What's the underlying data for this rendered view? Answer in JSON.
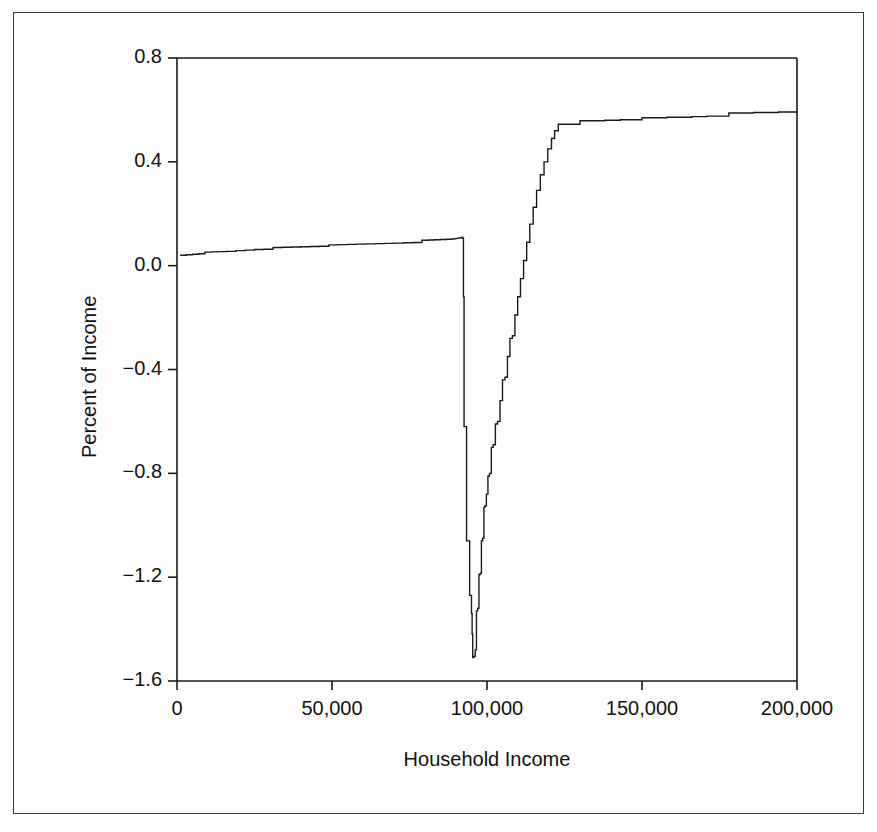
{
  "chart_data": {
    "type": "line",
    "title": "",
    "subtitle": "",
    "xlabel": "Household Income",
    "ylabel": "Percent of Income",
    "xlim": [
      0,
      200000
    ],
    "ylim": [
      -1.6,
      0.8
    ],
    "xticks": [
      0,
      50000,
      100000,
      150000,
      200000
    ],
    "xticklabels": [
      "0",
      "50,000",
      "100,000",
      "150,000",
      "200,000"
    ],
    "yticks": [
      0.8,
      0.4,
      0.0,
      -0.4,
      -0.8,
      -1.2,
      -1.6
    ],
    "yticklabels": [
      "0.8",
      "0.4",
      "0.0",
      "-0.4",
      "-0.8",
      "-1.2",
      "-1.6"
    ],
    "grid": false,
    "legend": null,
    "line_color": "#1a1a1a",
    "line_width": 1.4,
    "drawstyle": "steps-post",
    "annotations": [],
    "series": [
      {
        "name": "Percent of Income",
        "x": [
          1000,
          3000,
          5000,
          7000,
          9000,
          11000,
          13000,
          16000,
          19000,
          22000,
          25000,
          28000,
          31000,
          34000,
          37000,
          40000,
          43000,
          46000,
          49000,
          52000,
          55000,
          58000,
          61000,
          64000,
          67000,
          70000,
          73000,
          76000,
          79000,
          81000,
          83000,
          85000,
          87000,
          88500,
          89500,
          90200,
          90800,
          91300,
          91700,
          92000,
          92200,
          92400,
          92400,
          92600,
          93400,
          94400,
          95000,
          95200,
          95400,
          95800,
          96200,
          96600,
          97000,
          97400,
          97800,
          98200,
          98600,
          99000,
          99400,
          99800,
          100300,
          100800,
          101400,
          102000,
          102700,
          103400,
          104200,
          105000,
          105800,
          106600,
          107400,
          108200,
          109000,
          109900,
          110800,
          111800,
          112800,
          113800,
          114900,
          116000,
          117200,
          118400,
          119600,
          120800,
          121800,
          123000,
          130000,
          138000,
          143000,
          150000,
          158000,
          166000,
          171000,
          178000,
          186000,
          194000,
          200000
        ],
        "y": [
          0.04,
          0.042,
          0.044,
          0.046,
          0.052,
          0.053,
          0.054,
          0.055,
          0.058,
          0.06,
          0.062,
          0.063,
          0.07,
          0.071,
          0.072,
          0.073,
          0.074,
          0.075,
          0.08,
          0.081,
          0.082,
          0.083,
          0.084,
          0.085,
          0.086,
          0.087,
          0.088,
          0.089,
          0.098,
          0.099,
          0.1,
          0.101,
          0.102,
          0.103,
          0.104,
          0.105,
          0.106,
          0.107,
          0.108,
          0.11,
          0.105,
          0.095,
          -0.12,
          -0.62,
          -1.06,
          -1.27,
          -1.34,
          -1.42,
          -1.51,
          -1.505,
          -1.48,
          -1.33,
          -1.32,
          -1.19,
          -1.185,
          -1.06,
          -1.05,
          -0.93,
          -0.925,
          -0.88,
          -0.81,
          -0.8,
          -0.7,
          -0.69,
          -0.61,
          -0.6,
          -0.52,
          -0.44,
          -0.43,
          -0.35,
          -0.28,
          -0.27,
          -0.19,
          -0.12,
          -0.05,
          0.02,
          0.09,
          0.16,
          0.225,
          0.29,
          0.35,
          0.4,
          0.45,
          0.49,
          0.52,
          0.545,
          0.558,
          0.56,
          0.562,
          0.57,
          0.572,
          0.574,
          0.576,
          0.588,
          0.59,
          0.592,
          0.594
        ]
      }
    ]
  },
  "axes": {
    "y_title": "Percent of Income",
    "x_title": "Household Income"
  }
}
